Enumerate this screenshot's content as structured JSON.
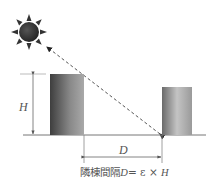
{
  "diagram": {
    "labels": {
      "height": "H",
      "distance": "D"
    },
    "caption": {
      "prefix": "隣棟間隔",
      "var_d": "D",
      "equals": "=",
      "epsilon": "ε",
      "times": "×",
      "var_h": "H"
    },
    "elements": {
      "sun": "sun-icon",
      "sun_ray": "dashed line from sun to base of rear building",
      "front_building": "taller building of height H",
      "rear_building": "shorter building at distance D"
    },
    "colors": {
      "building_dark": "#4a4a4a",
      "building_light": "#b5b5b5",
      "line": "#666666",
      "sun": "#2e2e2e"
    }
  }
}
